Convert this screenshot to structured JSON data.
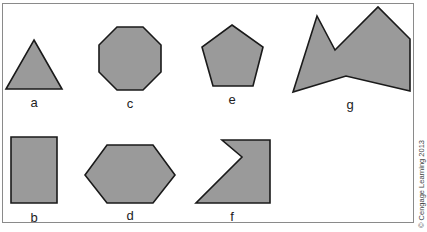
{
  "figure": {
    "shapes": [
      {
        "label": "a",
        "name": "triangle",
        "points": "34,40 62,89 6,89"
      },
      {
        "label": "b",
        "name": "rectangle",
        "points": "11,137 57,137 57,203 11,203"
      },
      {
        "label": "c",
        "name": "octagon",
        "points": "117,27 143,27 161,45 161,72 143,90 117,90 99,72 99,45"
      },
      {
        "label": "d",
        "name": "hexagon",
        "points": "107,145 153,145 175,175 153,203 107,203 85,175"
      },
      {
        "label": "e",
        "name": "pentagon",
        "points": "232,25 263,47 253,86 213,86 202,47"
      },
      {
        "label": "f",
        "name": "concave-pentagon",
        "points": "222,140 270,140 270,203 196,203 242,157"
      },
      {
        "label": "g",
        "name": "irregular-concave-polygon",
        "points": "293,92 317,16 335,50 378,7 410,39 410,91 346,76"
      }
    ],
    "labels": {
      "a": "a",
      "b": "b",
      "c": "c",
      "d": "d",
      "e": "e",
      "f": "f",
      "g": "g"
    },
    "credit": "© Cengage Learning 2013",
    "colors": {
      "fill": "#9a9a9a",
      "stroke": "#1a1a1a",
      "frame": "#8a8a8a"
    }
  }
}
